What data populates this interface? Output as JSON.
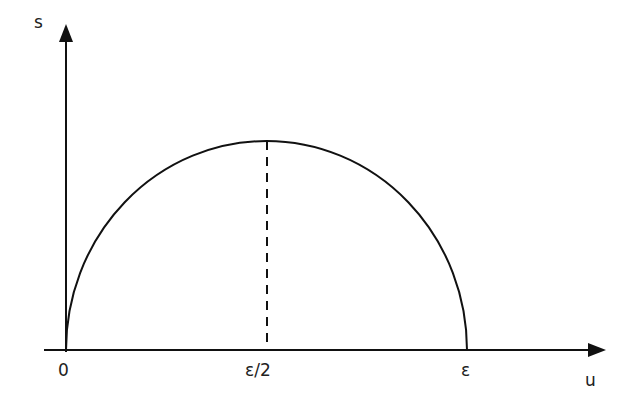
{
  "diagram": {
    "type": "semicircle-plot",
    "axes": {
      "y_label": "s",
      "x_label": "u"
    },
    "ticks": {
      "origin": "0",
      "mid": "ε/2",
      "end": "ε"
    },
    "colors": {
      "stroke": "#111111",
      "background": "#ffffff"
    }
  }
}
